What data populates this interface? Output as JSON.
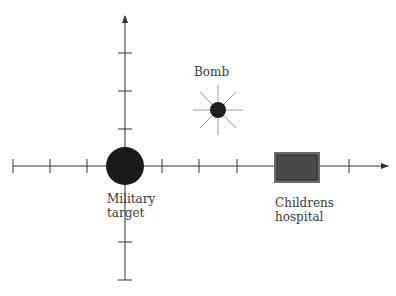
{
  "diagram": {
    "axes": {
      "origin": [
        125,
        166
      ],
      "x_axis": {
        "from": 13,
        "to": 388,
        "ticks": [
          13,
          50,
          87,
          162,
          199,
          237,
          349
        ]
      },
      "y_axis": {
        "from": 280,
        "to": 16,
        "ticks": [
          53,
          91,
          129,
          242,
          280
        ]
      }
    },
    "nodes": {
      "bomb": {
        "label": "Bomb",
        "shape": "burst-circle"
      },
      "military": {
        "label_line1": "Military",
        "label_line2": "target",
        "shape": "circle"
      },
      "hospital": {
        "label_line1": "Childrens",
        "label_line2": "hospital",
        "shape": "rectangle"
      }
    },
    "colors": {
      "axis": "#333333",
      "military_fill": "#1a1a1a",
      "bomb_fill": "#1e1e1e",
      "bomb_rays": "#9a9a9a",
      "hospital_fill": "#4a4a4a",
      "hospital_border": "#6a6a6a"
    }
  }
}
